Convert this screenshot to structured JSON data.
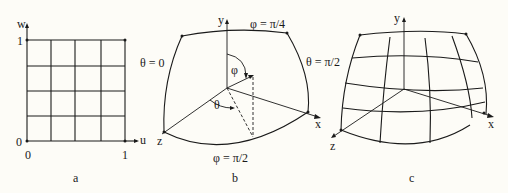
{
  "panels": {
    "a": {
      "caption": "a",
      "axis_u": "u",
      "axis_w": "w",
      "tick_w_1": "1",
      "tick_w_0": "0",
      "tick_u_0": "0",
      "tick_u_1": "1"
    },
    "b": {
      "caption": "b",
      "axis_x": "x",
      "axis_y": "y",
      "axis_z": "z",
      "label_phi_top": "φ = π/4",
      "label_phi_bottom": "φ = π/2",
      "label_theta_left": "θ = 0",
      "label_theta_right": "θ = π/2",
      "angle_phi": "φ",
      "angle_theta": "θ"
    },
    "c": {
      "caption": "c",
      "axis_x": "x",
      "axis_y": "y",
      "axis_z": "z"
    }
  }
}
